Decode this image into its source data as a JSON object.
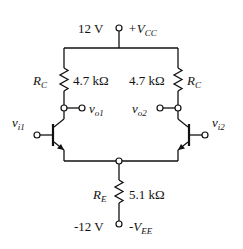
{
  "diagram": {
    "type": "circuit",
    "title": "",
    "supply_positive": {
      "value": "12 V",
      "name": "+V",
      "sub": "CC"
    },
    "supply_negative": {
      "value": "-12 V",
      "name": "-V",
      "sub": "EE"
    },
    "collector_resistor_left": {
      "name": "R",
      "sub": "C",
      "value": "4.7 kΩ"
    },
    "collector_resistor_right": {
      "name": "R",
      "sub": "C",
      "value": "4.7 kΩ"
    },
    "emitter_resistor": {
      "name": "R",
      "sub": "E",
      "value": "5.1 kΩ"
    },
    "outputs": [
      {
        "name": "v",
        "sub": "o1"
      },
      {
        "name": "v",
        "sub": "o2"
      }
    ],
    "inputs": [
      {
        "name": "v",
        "sub": "i1"
      },
      {
        "name": "v",
        "sub": "i2"
      }
    ],
    "transistors": [
      "Q1 (npn, left)",
      "Q2 (npn, right)"
    ]
  }
}
